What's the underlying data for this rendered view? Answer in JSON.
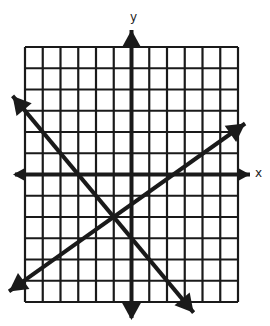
{
  "chart_data": {
    "type": "line",
    "title": "",
    "xlabel": "x",
    "ylabel": "y",
    "grid": true,
    "xlim": [
      -6,
      6
    ],
    "ylim": [
      -6,
      6
    ],
    "tick_labels": false,
    "series": [
      {
        "name": "line-decreasing",
        "slope": -1,
        "intercept": -3,
        "x": [
          -6.7,
          3.5
        ],
        "y": [
          3.7,
          -6.5
        ]
      },
      {
        "name": "line-increasing",
        "slope": 0.6,
        "intercept": -1.4,
        "x": [
          -6.9,
          6.4
        ],
        "y": [
          -5.5,
          2.4
        ]
      }
    ],
    "intersection": {
      "x": -1,
      "y": -2
    },
    "annotations": []
  },
  "labels": {
    "x_axis": "x",
    "y_axis": "y"
  },
  "colors": {
    "ink": "#1a1a1a",
    "background": "#ffffff"
  }
}
